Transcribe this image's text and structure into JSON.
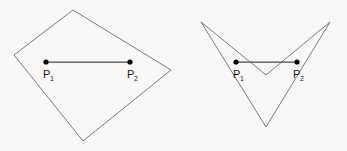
{
  "figure": {
    "background_color": "#f9f8f6",
    "outline_color": "#6b6b6b",
    "segment_color": "#4a4a4a",
    "point_color": "#000000",
    "label_color": "#1a1a1a",
    "shapes": [
      {
        "name": "convex-quadrilateral",
        "kind": "convex",
        "vertices": "73,10 171,70 83,141 14,55",
        "points": [
          {
            "id": "p1",
            "label": "P",
            "subscript": "1",
            "x": 46,
            "y": 62
          },
          {
            "id": "p2",
            "label": "P",
            "subscript": "2",
            "x": 130,
            "y": 62
          }
        ],
        "segment": {
          "x1": 46,
          "y1": 62,
          "x2": 130,
          "y2": 62
        }
      },
      {
        "name": "concave-dart-polygon",
        "kind": "concave",
        "vertices": "201,22 266,75 330,22 266,127",
        "points": [
          {
            "id": "p1",
            "label": "P",
            "subscript": "1",
            "x": 236,
            "y": 62
          },
          {
            "id": "p2",
            "label": "P",
            "subscript": "2",
            "x": 297,
            "y": 62
          }
        ],
        "segment": {
          "x1": 236,
          "y1": 62,
          "x2": 297,
          "y2": 62
        }
      }
    ]
  }
}
